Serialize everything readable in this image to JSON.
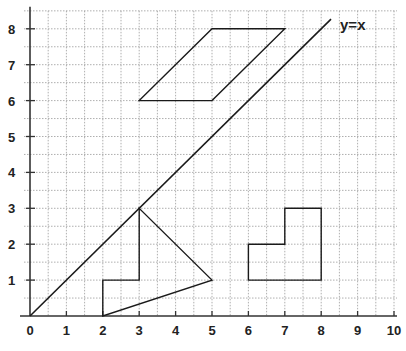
{
  "chart_data": {
    "type": "line",
    "title": "",
    "xlabel": "",
    "ylabel": "",
    "xlim": [
      0,
      10
    ],
    "ylim": [
      0,
      8.5
    ],
    "grid": true,
    "grid_step": 0.5,
    "x_ticks": [
      "0",
      "1",
      "2",
      "3",
      "4",
      "5",
      "6",
      "7",
      "8",
      "9",
      "10"
    ],
    "y_ticks": [
      "1",
      "2",
      "3",
      "4",
      "5",
      "6",
      "7",
      "8"
    ],
    "annotations": [
      {
        "text": "y=x",
        "x": 8.6,
        "y": 8.1
      }
    ],
    "series": [
      {
        "name": "y=x",
        "kind": "line",
        "points": [
          [
            0,
            0
          ],
          [
            8.27,
            8.27
          ]
        ]
      },
      {
        "name": "parallelogram",
        "kind": "polygon",
        "points": [
          [
            3,
            6
          ],
          [
            5,
            6
          ],
          [
            7,
            8
          ],
          [
            5,
            8
          ]
        ]
      },
      {
        "name": "triangle-with-step",
        "kind": "polygon",
        "points": [
          [
            2,
            0
          ],
          [
            2,
            1
          ],
          [
            3,
            1
          ],
          [
            3,
            3
          ],
          [
            5,
            1
          ]
        ]
      },
      {
        "name": "l-shape",
        "kind": "polygon",
        "points": [
          [
            6,
            1
          ],
          [
            6,
            2
          ],
          [
            7,
            2
          ],
          [
            7,
            3
          ],
          [
            8,
            3
          ],
          [
            8,
            1
          ]
        ]
      }
    ]
  },
  "colors": {
    "line": "#1a1a1a",
    "grid": "#9a9a9a",
    "axis": "#333333"
  }
}
